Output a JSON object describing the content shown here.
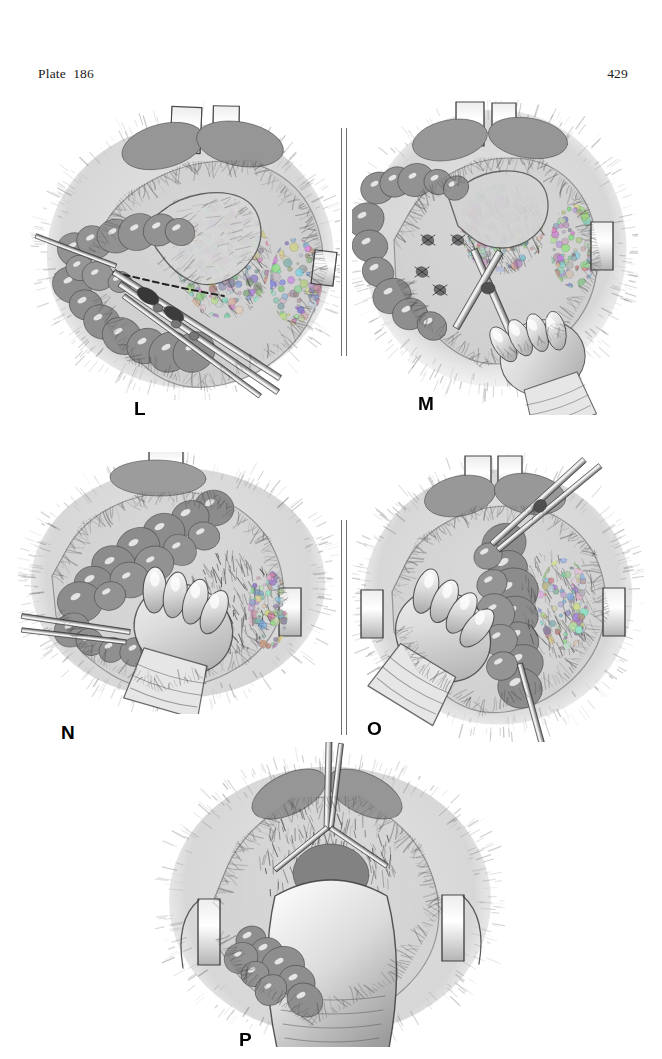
{
  "page": {
    "plate_label": "Plate  186",
    "page_number": "429",
    "background_color": "#ffffff",
    "ink_color": "#1a1a1a"
  },
  "figure": {
    "caption_color": "#000000",
    "divider_color": "#6f6f6f",
    "panels": [
      {
        "letter": "L",
        "subject": "operative-field-dissection-with-clamps",
        "description": "Surgical field with wound retractors at top, mobilized colon and mesentery exposed, two long hemostatic clamps and a dashed incision line across the mesentery",
        "row": 1,
        "column": "left",
        "instruments": [
          "wound-retractor",
          "hemostat-clamp",
          "hemostat-clamp",
          "dashed-incision-line"
        ]
      },
      {
        "letter": "M",
        "subject": "operative-field-with-surgeon-hand-and-scissors",
        "description": "Same field after division of mesenteric vessels; ligature knots along the cut edge, scissors held by the surgeon's gloved hand entering from the lower right",
        "row": 1,
        "column": "right",
        "instruments": [
          "wound-retractor",
          "scissors",
          "gloved-hand",
          "ligature-knots"
        ]
      },
      {
        "letter": "N",
        "subject": "gloved-hand-grasping-bowel-loop",
        "description": "Gloved hand grasping and elevating the mobilized bowel loop, forceps entering at the left, retractor blades at both margins",
        "row": 2,
        "column": "left",
        "instruments": [
          "gloved-hand",
          "forceps",
          "wound-retractor"
        ]
      },
      {
        "letter": "O",
        "subject": "hand-holding-bowel-with-long-scissors",
        "description": "Surgeon's hand cradling the bowel segment while long curved scissors are introduced from the upper right; retractor blades at both lateral margins",
        "row": 2,
        "column": "right",
        "instruments": [
          "gloved-hand",
          "long-scissors",
          "wound-retractor",
          "wound-retractor"
        ]
      },
      {
        "letter": "P",
        "subject": "forearm-delivering-specimen-through-wound",
        "description": "Forearm and hand delivering the specimen through the abdominal wound, self-retaining retractor blades at the left and right edges, scissors at the top of the incision",
        "row": 3,
        "column": "center",
        "instruments": [
          "gloved-hand",
          "forearm",
          "self-retaining-retractor",
          "self-retaining-retractor",
          "scissors"
        ]
      }
    ]
  }
}
